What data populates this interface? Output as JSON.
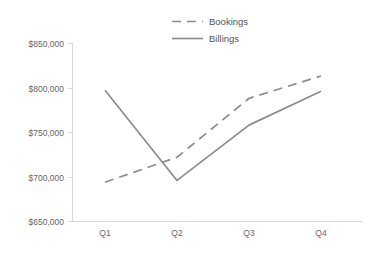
{
  "chart_data": {
    "type": "line",
    "title": "",
    "xlabel": "",
    "ylabel": "",
    "categories": [
      "Q1",
      "Q2",
      "Q3",
      "Q4"
    ],
    "series": [
      {
        "name": "Bookings",
        "style": "dashed",
        "color": "#8c8c8c",
        "values": [
          694000,
          722000,
          788000,
          813000
        ]
      },
      {
        "name": "Billings",
        "style": "solid",
        "color": "#8c8c8c",
        "values": [
          797000,
          696000,
          758000,
          796000
        ]
      }
    ],
    "ylim": [
      650000,
      850000
    ],
    "ytick_values": [
      650000,
      700000,
      750000,
      800000,
      850000
    ],
    "ytick_labels": [
      "$650,000",
      "$700,000",
      "$750,000",
      "$800,000",
      "$850,000"
    ],
    "xtick_labels": [
      "Q1",
      "Q2",
      "Q3",
      "Q4"
    ],
    "grid": false,
    "legend_position": "top-center",
    "axis_color": "#d9d9d9",
    "tick_label_color": "#666666",
    "legend_label_color": "#555555",
    "background_color": "#ffffff"
  },
  "legend": {
    "entries": [
      {
        "label": "Bookings"
      },
      {
        "label": "Billings"
      }
    ]
  },
  "axes": {
    "y": {
      "labels": [
        {
          "text": "$850,000"
        },
        {
          "text": "$800,000"
        },
        {
          "text": "$750,000"
        },
        {
          "text": "$700,000"
        },
        {
          "text": "$650,000"
        }
      ]
    },
    "x": {
      "labels": [
        {
          "text": "Q1"
        },
        {
          "text": "Q2"
        },
        {
          "text": "Q3"
        },
        {
          "text": "Q4"
        }
      ]
    }
  }
}
